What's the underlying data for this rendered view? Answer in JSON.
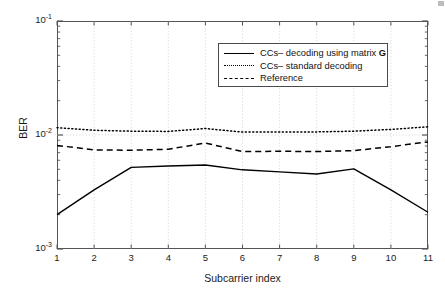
{
  "chart_data": {
    "type": "line",
    "title": "",
    "xlabel": "Subcarrier index",
    "ylabel": "BER",
    "x": [
      1,
      2,
      3,
      4,
      5,
      6,
      7,
      8,
      9,
      10,
      11
    ],
    "xlim": [
      1,
      11
    ],
    "ylim": [
      0.001,
      0.1
    ],
    "yscale": "log",
    "grid": true,
    "legend_position": "upper-center",
    "xtick_labels": [
      "1",
      "2",
      "3",
      "4",
      "5",
      "6",
      "7",
      "8",
      "9",
      "10",
      "11"
    ],
    "ytick_labels": [
      "10-3",
      "10-2",
      "10-1"
    ],
    "ytick_values": [
      0.001,
      0.01,
      0.1
    ],
    "series": [
      {
        "name": "CCs– decoding using matrix G",
        "style": "solid",
        "color": "#000000",
        "values": [
          0.002,
          0.0033,
          0.0052,
          0.00535,
          0.00545,
          0.00495,
          0.00475,
          0.00455,
          0.00505,
          0.0033,
          0.0021
        ]
      },
      {
        "name": "CCs– standard decoding",
        "style": "dotted",
        "color": "#000000",
        "values": [
          0.0116,
          0.011,
          0.0108,
          0.01075,
          0.0114,
          0.0106,
          0.0106,
          0.01065,
          0.0108,
          0.0112,
          0.0118
        ]
      },
      {
        "name": "Reference",
        "style": "dashed",
        "color": "#000000",
        "values": [
          0.0081,
          0.0074,
          0.00735,
          0.0075,
          0.0085,
          0.00715,
          0.0072,
          0.00715,
          0.0073,
          0.0079,
          0.0087
        ]
      }
    ]
  },
  "axes": {
    "ylabel": "BER",
    "xlabel": "Subcarrier index",
    "ytick_top_mantissa": "10",
    "ytick_top_exp": "-1",
    "ytick_mid_mantissa": "10",
    "ytick_mid_exp": "-2",
    "ytick_bot_mantissa": "10",
    "ytick_bot_exp": "-3"
  },
  "legend": {
    "entries": [
      {
        "label_main": "CCs– decoding using matrix ",
        "label_bold": "G",
        "style": "solid"
      },
      {
        "label_main": "CCs– standard decoding",
        "label_bold": "",
        "style": "dotted"
      },
      {
        "label_main": "Reference",
        "label_bold": "",
        "style": "dashed"
      }
    ]
  }
}
